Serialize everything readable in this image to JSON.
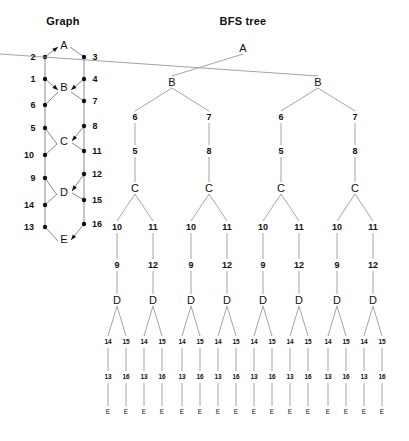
{
  "canvas": {
    "width": 409,
    "height": 441,
    "background": "#ffffff"
  },
  "style": {
    "edge_color": "#8a8a8a",
    "node_color": "#111111",
    "text_color": "#111111"
  },
  "panels": [
    {
      "id": "graph",
      "title": "Graph",
      "title_x": 63,
      "title_y": 22
    },
    {
      "id": "bfs",
      "title": "BFS tree",
      "title_x": 243,
      "title_y": 22
    }
  ],
  "graph_panel": {
    "title": "Graph",
    "vertices": [
      {
        "label": "A",
        "x": 64,
        "y": 45,
        "kind": "letter"
      },
      {
        "label": "B",
        "x": 64,
        "y": 87,
        "kind": "letter"
      },
      {
        "label": "C",
        "x": 64,
        "y": 141,
        "kind": "letter"
      },
      {
        "label": "D",
        "x": 64,
        "y": 192,
        "kind": "letter"
      },
      {
        "label": "E",
        "x": 64,
        "y": 239,
        "kind": "letter"
      }
    ],
    "edge_nodes": [
      {
        "label": "2",
        "x": 45,
        "y": 57,
        "lx": 33,
        "ly": 57
      },
      {
        "label": "3",
        "x": 84,
        "y": 57,
        "lx": 95,
        "ly": 57
      },
      {
        "label": "1",
        "x": 45,
        "y": 79,
        "lx": 33,
        "ly": 79
      },
      {
        "label": "4",
        "x": 84,
        "y": 79,
        "lx": 95,
        "ly": 79
      },
      {
        "label": "6",
        "x": 45,
        "y": 105,
        "lx": 33,
        "ly": 105
      },
      {
        "label": "7",
        "x": 84,
        "y": 101,
        "lx": 95,
        "ly": 101
      },
      {
        "label": "5",
        "x": 45,
        "y": 128,
        "lx": 33,
        "ly": 128
      },
      {
        "label": "8",
        "x": 84,
        "y": 126,
        "lx": 95,
        "ly": 126
      },
      {
        "label": "10",
        "x": 45,
        "y": 155,
        "lx": 29,
        "ly": 155
      },
      {
        "label": "11",
        "x": 84,
        "y": 151,
        "lx": 97,
        "ly": 151
      },
      {
        "label": "9",
        "x": 45,
        "y": 178,
        "lx": 33,
        "ly": 178
      },
      {
        "label": "12",
        "x": 84,
        "y": 174,
        "lx": 97,
        "ly": 174
      },
      {
        "label": "14",
        "x": 45,
        "y": 205,
        "lx": 29,
        "ly": 205
      },
      {
        "label": "15",
        "x": 84,
        "y": 200,
        "lx": 97,
        "ly": 200
      },
      {
        "label": "13",
        "x": 45,
        "y": 227,
        "lx": 29,
        "ly": 227
      },
      {
        "label": "16",
        "x": 84,
        "y": 224,
        "lx": 97,
        "ly": 224
      }
    ],
    "edges": [
      {
        "from": [
          45,
          57
        ],
        "to": [
          58,
          47
        ],
        "arrow": true
      },
      {
        "from": [
          70,
          47
        ],
        "to": [
          84,
          57
        ],
        "arrow": false
      },
      {
        "from": [
          45,
          57
        ],
        "to": [
          45,
          79
        ],
        "arrow": false
      },
      {
        "from": [
          84,
          57
        ],
        "to": [
          84,
          79
        ],
        "arrow": false
      },
      {
        "from": [
          45,
          79
        ],
        "to": [
          58,
          90
        ],
        "arrow": true
      },
      {
        "from": [
          84,
          79
        ],
        "to": [
          71,
          90
        ],
        "arrow": true
      },
      {
        "from": [
          45,
          79
        ],
        "to": [
          45,
          105
        ],
        "arrow": false
      },
      {
        "from": [
          84,
          79
        ],
        "to": [
          84,
          101
        ],
        "arrow": false
      },
      {
        "from": [
          45,
          105
        ],
        "to": [
          58,
          92
        ],
        "arrow": false
      },
      {
        "from": [
          84,
          101
        ],
        "to": [
          71,
          92
        ],
        "arrow": false
      },
      {
        "from": [
          45,
          105
        ],
        "to": [
          45,
          128
        ],
        "arrow": false
      },
      {
        "from": [
          84,
          101
        ],
        "to": [
          84,
          126
        ],
        "arrow": false
      },
      {
        "from": [
          45,
          128
        ],
        "to": [
          57,
          144
        ],
        "arrow": false
      },
      {
        "from": [
          84,
          126
        ],
        "to": [
          72,
          141
        ],
        "arrow": true
      },
      {
        "from": [
          45,
          128
        ],
        "to": [
          45,
          155
        ],
        "arrow": false
      },
      {
        "from": [
          84,
          126
        ],
        "to": [
          84,
          151
        ],
        "arrow": false
      },
      {
        "from": [
          45,
          155
        ],
        "to": [
          57,
          144
        ],
        "arrow": false
      },
      {
        "from": [
          84,
          151
        ],
        "to": [
          72,
          143
        ],
        "arrow": false
      },
      {
        "from": [
          45,
          155
        ],
        "to": [
          45,
          178
        ],
        "arrow": false
      },
      {
        "from": [
          84,
          151
        ],
        "to": [
          84,
          174
        ],
        "arrow": false
      },
      {
        "from": [
          45,
          178
        ],
        "to": [
          57,
          195
        ],
        "arrow": false
      },
      {
        "from": [
          84,
          174
        ],
        "to": [
          72,
          191
        ],
        "arrow": true
      },
      {
        "from": [
          45,
          178
        ],
        "to": [
          45,
          205
        ],
        "arrow": false
      },
      {
        "from": [
          84,
          174
        ],
        "to": [
          84,
          200
        ],
        "arrow": false
      },
      {
        "from": [
          45,
          205
        ],
        "to": [
          57,
          194
        ],
        "arrow": false
      },
      {
        "from": [
          84,
          200
        ],
        "to": [
          72,
          193
        ],
        "arrow": false
      },
      {
        "from": [
          45,
          205
        ],
        "to": [
          45,
          227
        ],
        "arrow": false
      },
      {
        "from": [
          84,
          200
        ],
        "to": [
          84,
          224
        ],
        "arrow": false
      },
      {
        "from": [
          45,
          227
        ],
        "to": [
          58,
          241
        ],
        "arrow": false
      },
      {
        "from": [
          84,
          224
        ],
        "to": [
          71,
          240
        ],
        "arrow": true
      }
    ]
  },
  "bfs_panel": {
    "title": "BFS tree",
    "levels": [
      {
        "name": "root",
        "y": 48,
        "labels": [
          "A"
        ],
        "kind": "letter"
      },
      {
        "name": "b-level",
        "y": 82,
        "labels": [
          "B",
          "B"
        ],
        "kind": "letter"
      },
      {
        "name": "edge-67",
        "y": 117,
        "labels": [
          "6",
          "7",
          "6",
          "7"
        ],
        "kind": "num"
      },
      {
        "name": "edge-58",
        "y": 151,
        "labels": [
          "5",
          "8",
          "5",
          "8"
        ],
        "kind": "num"
      },
      {
        "name": "c-level",
        "y": 188,
        "labels": [
          "C",
          "C",
          "C",
          "C"
        ],
        "kind": "letter"
      },
      {
        "name": "edge-1011",
        "y": 227,
        "labels": [
          "10",
          "11",
          "10",
          "11",
          "10",
          "11",
          "10",
          "11"
        ],
        "kind": "num"
      },
      {
        "name": "edge-912",
        "y": 265,
        "labels": [
          "9",
          "12",
          "9",
          "12",
          "9",
          "12",
          "9",
          "12"
        ],
        "kind": "num"
      },
      {
        "name": "d-level",
        "y": 300,
        "labels": [
          "D",
          "D",
          "D",
          "D",
          "D",
          "D",
          "D",
          "D"
        ],
        "kind": "letter"
      },
      {
        "name": "edge-1415",
        "y": 342,
        "labels": [
          "14",
          "15",
          "14",
          "15",
          "14",
          "15",
          "14",
          "15",
          "14",
          "15",
          "14",
          "15",
          "14",
          "15",
          "14",
          "15"
        ],
        "kind": "num-small"
      },
      {
        "name": "edge-1316",
        "y": 377,
        "labels": [
          "13",
          "16",
          "13",
          "16",
          "13",
          "16",
          "13",
          "16",
          "13",
          "16",
          "13",
          "16",
          "13",
          "16",
          "13",
          "16"
        ],
        "kind": "num-small"
      },
      {
        "name": "e-level",
        "y": 412,
        "labels": [
          "E",
          "E",
          "E",
          "E",
          "E",
          "E",
          "E",
          "E",
          "E",
          "E",
          "E",
          "E",
          "E",
          "E",
          "E",
          "E"
        ],
        "kind": "letter-small"
      }
    ],
    "tree_description": {
      "root": "A",
      "branching": "A -> 2 B children; each B -> chains 6-5-C and 7-8-C; each C -> chains 10-9-D and 11-12-D; each D -> chains 14-13-E and 15-16-E",
      "leaf_count": 16
    }
  }
}
